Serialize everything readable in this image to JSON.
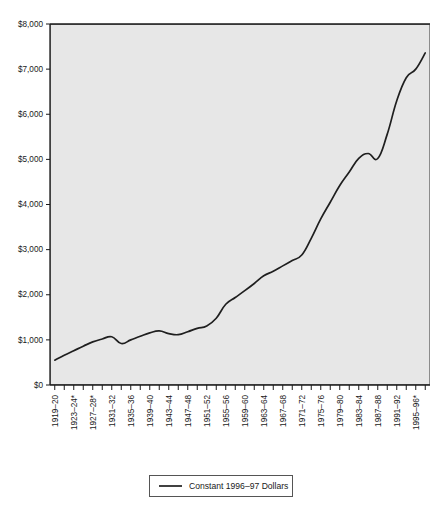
{
  "chart_data": {
    "type": "line",
    "title": "",
    "subtitle": "",
    "xlabel": "",
    "ylabel": "",
    "ylim": [
      0,
      8000
    ],
    "ytick_values": [
      0,
      1000,
      2000,
      3000,
      4000,
      5000,
      6000,
      7000,
      8000
    ],
    "ytick_labels": [
      "$0",
      "$1,000",
      "$2,000",
      "$3,000",
      "$4,000",
      "$5,000",
      "$6,000",
      "$7,000",
      "$8,000"
    ],
    "grid": false,
    "legend_position": "bottom-center",
    "legend": [
      "Constant  1996–97 Dollars"
    ],
    "xtick_labels": [
      "1919–20",
      "1923–24*",
      "1927–28*",
      "1931–32",
      "1935–36",
      "1939–40",
      "1943–44",
      "1947–48",
      "1951–52",
      "1955–56",
      "1959–60",
      "1963–64",
      "1967–68",
      "1971–72",
      "1975–76",
      "1979–80",
      "1983–84",
      "1987–88",
      "1991–92",
      "1995–96*"
    ],
    "x_categories": [
      "1919–20",
      "1921–22",
      "1923–24*",
      "1925–26",
      "1927–28*",
      "1929–30",
      "1931–32",
      "1933–34",
      "1935–36",
      "1937–38",
      "1939–40",
      "1941–42",
      "1943–44",
      "1945–46",
      "1947–48",
      "1949–50",
      "1951–52",
      "1953–54",
      "1955–56",
      "1957–58",
      "1959–60",
      "1961–62",
      "1963–64",
      "1965–66",
      "1967–68",
      "1969–70",
      "1971–72",
      "1973–74",
      "1975–76",
      "1977–78",
      "1979–80",
      "1981–82",
      "1983–84",
      "1985–86",
      "1987–88",
      "1989–90",
      "1991–92",
      "1993–94",
      "1995–96*",
      "1996–97"
    ],
    "series": [
      {
        "name": "Constant  1996–97 Dollars",
        "color": "#1f1f1f",
        "values": [
          550,
          660,
          760,
          860,
          955,
          1020,
          1070,
          920,
          1000,
          1080,
          1155,
          1200,
          1140,
          1115,
          1180,
          1255,
          1310,
          1480,
          1790,
          1940,
          2090,
          2250,
          2420,
          2520,
          2640,
          2760,
          2880,
          3250,
          3680,
          4050,
          4420,
          4720,
          5020,
          5130,
          5020,
          5560,
          6300,
          6810,
          7000,
          7360
        ]
      }
    ]
  },
  "axes": {
    "y_axis_name": "dollars-axis",
    "x_axis_name": "school-year-axis"
  }
}
